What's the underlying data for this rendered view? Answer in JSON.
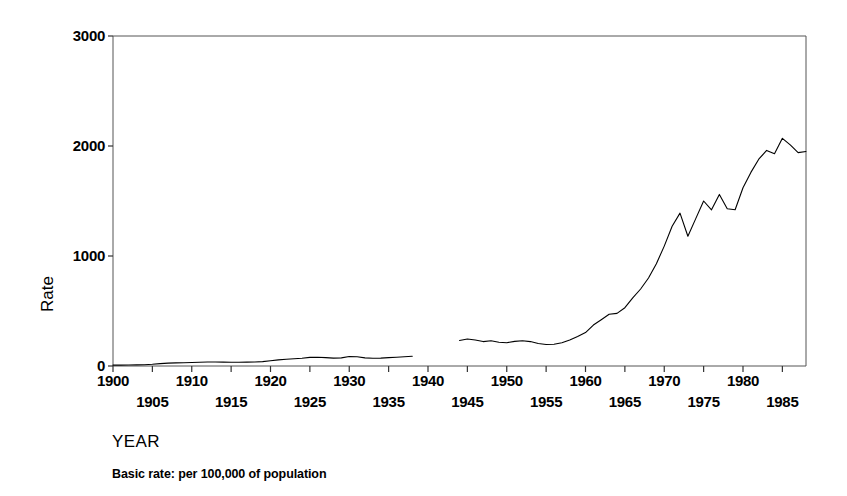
{
  "chart_data": {
    "type": "line",
    "title": "",
    "xlabel": "YEAR",
    "ylabel": "Rate",
    "caption": "Basic rate: per 100,000 of population",
    "xlim": [
      1900,
      1988
    ],
    "ylim": [
      0,
      3000
    ],
    "yticks": [
      0,
      1000,
      2000,
      3000
    ],
    "ytick_labels": [
      "0",
      "1000",
      "2000",
      "3000"
    ],
    "xticks": [
      1900,
      1905,
      1910,
      1915,
      1920,
      1925,
      1930,
      1935,
      1940,
      1945,
      1950,
      1955,
      1960,
      1965,
      1970,
      1975,
      1980,
      1985
    ],
    "xtick_labels": [
      "1900",
      "1905",
      "1910",
      "1915",
      "1920",
      "1925",
      "1930",
      "1935",
      "1940",
      "1945",
      "1950",
      "1955",
      "1960",
      "1965",
      "1970",
      "1975",
      "1980",
      "1985"
    ],
    "xtick_rows": [
      0,
      1,
      0,
      1,
      0,
      1,
      0,
      1,
      0,
      1,
      0,
      1,
      0,
      1,
      0,
      1,
      0,
      1
    ],
    "grid": false,
    "legend": null,
    "line_color": "#000000",
    "line_width": 1.1,
    "series": [
      {
        "name": "Rate per 100,000 of population",
        "gap_note": "No data recorded 1939-1943",
        "segments": [
          {
            "x": [
              1900,
              1901,
              1902,
              1903,
              1904,
              1905,
              1906,
              1907,
              1908,
              1909,
              1910,
              1911,
              1912,
              1913,
              1914,
              1915,
              1916,
              1917,
              1918,
              1919,
              1920,
              1921,
              1922,
              1923,
              1924,
              1925,
              1926,
              1927,
              1928,
              1929,
              1930,
              1931,
              1932,
              1933,
              1934,
              1935,
              1936,
              1937,
              1938
            ],
            "y": [
              8,
              8,
              9,
              10,
              12,
              16,
              22,
              26,
              28,
              30,
              32,
              34,
              36,
              36,
              35,
              34,
              34,
              35,
              36,
              40,
              48,
              56,
              62,
              66,
              70,
              78,
              80,
              76,
              72,
              74,
              86,
              84,
              74,
              70,
              72,
              76,
              80,
              84,
              88
            ]
          },
          {
            "x": [
              1944,
              1945,
              1946,
              1947,
              1948,
              1949,
              1950,
              1951,
              1952,
              1953,
              1954,
              1955,
              1956,
              1957,
              1958,
              1959,
              1960,
              1961,
              1962,
              1963,
              1964,
              1965,
              1966,
              1967,
              1968,
              1969,
              1970,
              1971,
              1972,
              1973,
              1974,
              1975,
              1976,
              1977,
              1978,
              1979,
              1980,
              1981,
              1982,
              1983,
              1984,
              1985,
              1986,
              1987,
              1988
            ],
            "y": [
              232,
              246,
              236,
              222,
              230,
              216,
              212,
              224,
              230,
              222,
              204,
              196,
              198,
              212,
              236,
              268,
              304,
              372,
              420,
              470,
              478,
              530,
              620,
              700,
              800,
              930,
              1090,
              1270,
              1390,
              1180,
              1340,
              1500,
              1420,
              1560,
              1430,
              1420,
              1620,
              1760,
              1880,
              1960,
              1930,
              2070,
              2010,
              1940,
              1950
            ]
          }
        ]
      }
    ]
  }
}
